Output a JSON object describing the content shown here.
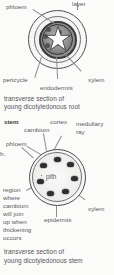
{
  "figure": {
    "title_hidden": "",
    "background_color": "#fbfbfa",
    "ink_color": "#58585a"
  },
  "root_section": {
    "labels": {
      "layer": "layer",
      "phloem": "phloem",
      "pericycle": "pericycle",
      "endodermis": "endodermis",
      "xylem": "xylem"
    },
    "caption_line_1": "transverse section of",
    "caption_line_2": "young dicotyledonous root",
    "structure": {
      "rings": [
        "piliferous layer",
        "cortex",
        "endodermis",
        "pericycle",
        "stele"
      ],
      "xylem_shape": "star",
      "xylem_arms": 5,
      "phloem_patches": 5
    }
  },
  "stem_section": {
    "labels": {
      "stem": "stem",
      "cambium": "cambium",
      "cortex": "cortex",
      "medullary": "medullary",
      "ray": "ray",
      "phloem": "phloem",
      "pith": "pith",
      "xylem": "xylem",
      "epidermis": "epidermis",
      "partial_left": "h."
    },
    "note_lines": [
      "region",
      "where",
      "cambium",
      "will join",
      "up when",
      "thickening",
      "occurs"
    ],
    "caption_line_1": "transverse section of",
    "caption_line_2": "young dicotyledonous stem",
    "structure": {
      "vascular_bundle_count": 7,
      "bundle_arrangement": "ring",
      "centre": "pith"
    }
  }
}
